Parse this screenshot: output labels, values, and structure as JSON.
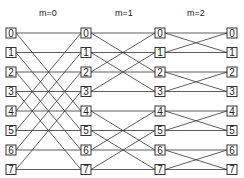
{
  "diagram": {
    "type": "butterfly-network",
    "stages": [
      {
        "label": "m=0",
        "x": 48
      },
      {
        "label": "m=1",
        "x": 124
      },
      {
        "label": "m=2",
        "x": 196
      }
    ],
    "columns_x": [
      11,
      86,
      160,
      232
    ],
    "rows_y": [
      33,
      52.5,
      72,
      91.5,
      111,
      130.5,
      150,
      169.5
    ],
    "node_labels": [
      "0",
      "1",
      "2",
      "3",
      "4",
      "5",
      "6",
      "7"
    ],
    "edges": [
      {
        "from_col": 0,
        "to_col": 1,
        "connections": [
          [
            0,
            0
          ],
          [
            1,
            1
          ],
          [
            2,
            2
          ],
          [
            3,
            3
          ],
          [
            4,
            4
          ],
          [
            5,
            5
          ],
          [
            6,
            6
          ],
          [
            7,
            7
          ],
          [
            0,
            4
          ],
          [
            1,
            5
          ],
          [
            2,
            6
          ],
          [
            3,
            7
          ],
          [
            4,
            0
          ],
          [
            5,
            1
          ],
          [
            6,
            2
          ],
          [
            7,
            3
          ]
        ],
        "pattern": "all cross-over through center (distance 4)"
      },
      {
        "from_col": 1,
        "to_col": 2,
        "connections": [
          [
            0,
            0
          ],
          [
            1,
            1
          ],
          [
            2,
            2
          ],
          [
            3,
            3
          ],
          [
            4,
            4
          ],
          [
            5,
            5
          ],
          [
            6,
            6
          ],
          [
            7,
            7
          ],
          [
            0,
            2
          ],
          [
            1,
            3
          ],
          [
            2,
            0
          ],
          [
            3,
            1
          ],
          [
            4,
            6
          ],
          [
            5,
            7
          ],
          [
            6,
            4
          ],
          [
            7,
            5
          ]
        ],
        "pattern": "distance 2 butterflies"
      },
      {
        "from_col": 2,
        "to_col": 3,
        "connections": [
          [
            0,
            0
          ],
          [
            1,
            1
          ],
          [
            2,
            2
          ],
          [
            3,
            3
          ],
          [
            4,
            4
          ],
          [
            5,
            5
          ],
          [
            6,
            6
          ],
          [
            7,
            7
          ],
          [
            0,
            1
          ],
          [
            1,
            0
          ],
          [
            2,
            3
          ],
          [
            3,
            2
          ],
          [
            4,
            5
          ],
          [
            5,
            4
          ],
          [
            6,
            7
          ],
          [
            7,
            6
          ]
        ],
        "pattern": "distance 1 butterflies"
      }
    ],
    "colors": {
      "stroke": "#333333",
      "background": "#ffffff"
    }
  }
}
